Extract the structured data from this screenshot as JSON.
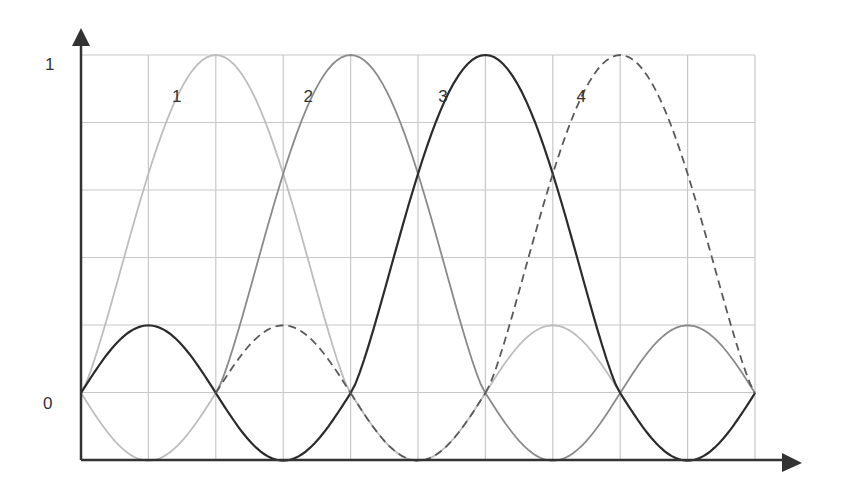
{
  "chart_data": {
    "type": "line",
    "title": "",
    "xlabel": "",
    "ylabel": "",
    "y_tick_labels": [
      "0",
      "1"
    ],
    "ylim": [
      -0.2,
      1
    ],
    "grid": true,
    "grid_columns": 10,
    "grid_rows": 6,
    "nodes": [
      0,
      1,
      2,
      3,
      4,
      5
    ],
    "series": [
      {
        "name": "1",
        "style": "solid",
        "color": "#bdbdbd",
        "peak_node": 1,
        "segments": [
          {
            "from": 0,
            "to": 2,
            "type": "hump",
            "amp": 1
          },
          {
            "from": 0,
            "to": 1,
            "type": "lobe",
            "amp": -0.2
          },
          {
            "from": 2,
            "to": 3,
            "type": "lobe",
            "amp": -0.2
          },
          {
            "from": 3,
            "to": 4,
            "type": "lobe",
            "amp": 0.2
          }
        ]
      },
      {
        "name": "2",
        "style": "solid",
        "color": "#8a8a8a",
        "peak_node": 2,
        "segments": [
          {
            "from": 1,
            "to": 3,
            "type": "hump",
            "amp": 1
          },
          {
            "from": 3,
            "to": 4,
            "type": "lobe",
            "amp": -0.2
          },
          {
            "from": 4,
            "to": 5,
            "type": "lobe",
            "amp": 0.2
          }
        ]
      },
      {
        "name": "3",
        "style": "solid",
        "color": "#2b2b2b",
        "peak_node": 3,
        "segments": [
          {
            "from": 2,
            "to": 4,
            "type": "hump",
            "amp": 1
          },
          {
            "from": 0,
            "to": 1,
            "type": "lobe",
            "amp": 0.2
          },
          {
            "from": 1,
            "to": 2,
            "type": "lobe",
            "amp": -0.2
          },
          {
            "from": 4,
            "to": 5,
            "type": "lobe",
            "amp": -0.2
          }
        ]
      },
      {
        "name": "4",
        "style": "dashed",
        "color": "#5a5a5a",
        "peak_node": 4,
        "segments": [
          {
            "from": 3,
            "to": 5,
            "type": "hump",
            "amp": 1
          },
          {
            "from": 1,
            "to": 2,
            "type": "lobe",
            "amp": 0.2
          },
          {
            "from": 2,
            "to": 3,
            "type": "lobe",
            "amp": -0.2
          }
        ]
      }
    ],
    "annotations": [
      {
        "text": "1",
        "x_col": 1.35,
        "y": 0.88
      },
      {
        "text": "2",
        "x_col": 3.3,
        "y": 0.88
      },
      {
        "text": "3",
        "x_col": 5.3,
        "y": 0.88
      },
      {
        "text": "4",
        "x_col": 7.35,
        "y": 0.88
      }
    ]
  },
  "axis": {
    "y_label_one": "1",
    "y_label_zero": "0",
    "axis_color": "#333333",
    "grid_color": "#c8c8c8"
  }
}
